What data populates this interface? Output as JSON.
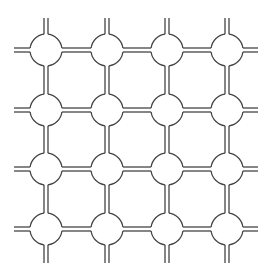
{
  "diagram": {
    "type": "grid-network",
    "columns": [
      46,
      107,
      167,
      227
    ],
    "rows": [
      50,
      110,
      169,
      229
    ],
    "node_radius": 16,
    "pipe_gap": 4,
    "stub_extent": {
      "left": 14,
      "right": 258,
      "top": 18,
      "bottom": 263
    },
    "stroke_color": "#444444",
    "stroke_width": 1.3,
    "background": "#ffffff"
  }
}
